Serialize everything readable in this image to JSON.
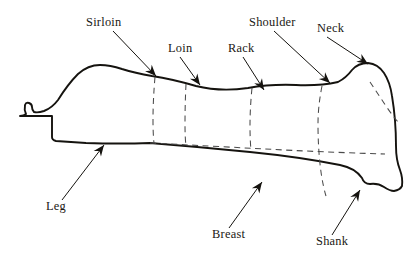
{
  "diagram": {
    "background_color": "#ffffff",
    "outline_color": "#15130f",
    "divider_color": "#4a4a4a",
    "label_color": "#1a1713",
    "labels": [
      {
        "id": "sirloin",
        "text": "Sirloin",
        "text_x": 86,
        "text_y": 26,
        "leader_from_x": 113,
        "leader_from_y": 31,
        "leader_to_x": 156,
        "leader_to_y": 76,
        "arrow_angle_deg": 46
      },
      {
        "id": "loin",
        "text": "Loin",
        "text_x": 168,
        "text_y": 52,
        "leader_from_x": 180,
        "leader_from_y": 57,
        "leader_to_x": 200,
        "leader_to_y": 85,
        "arrow_angle_deg": 55
      },
      {
        "id": "rack",
        "text": "Rack",
        "text_x": 228,
        "text_y": 52,
        "leader_from_x": 243,
        "leader_from_y": 57,
        "leader_to_x": 264,
        "leader_to_y": 90,
        "arrow_angle_deg": 58
      },
      {
        "id": "shoulder",
        "text": "Shoulder",
        "text_x": 249,
        "text_y": 26,
        "leader_from_x": 274,
        "leader_from_y": 31,
        "leader_to_x": 330,
        "leader_to_y": 83,
        "arrow_angle_deg": 43
      },
      {
        "id": "neck",
        "text": "Neck",
        "text_x": 317,
        "text_y": 32,
        "leader_from_x": 327,
        "leader_from_y": 37,
        "leader_to_x": 368,
        "leader_to_y": 64,
        "arrow_angle_deg": 33
      },
      {
        "id": "leg",
        "text": "Leg",
        "text_x": 46,
        "text_y": 210,
        "leader_from_x": 62,
        "leader_from_y": 200,
        "leader_to_x": 104,
        "leader_to_y": 145,
        "arrow_angle_deg": -52
      },
      {
        "id": "breast",
        "text": "Breast",
        "text_x": 212,
        "text_y": 238,
        "leader_from_x": 229,
        "leader_from_y": 228,
        "leader_to_x": 262,
        "leader_to_y": 182,
        "arrow_angle_deg": -54
      },
      {
        "id": "shank",
        "text": "Shank",
        "text_x": 316,
        "text_y": 245,
        "leader_from_x": 332,
        "leader_from_y": 235,
        "leader_to_x": 360,
        "leader_to_y": 190,
        "arrow_angle_deg": -58
      }
    ],
    "shapes": {
      "carcass_path": "M 52 116 L 52 137 Q 52 140 56 141 L 86 143 Q 120 144 150 143 Q 200 147 250 152 Q 300 157 340 165 Q 355 168 362 178 Q 364 184 370 184 Q 378 183 384 187 Q 390 191 394 191 Q 400 190 402 186 Q 403 178 400 170 Q 396 160 396 146 Q 396 120 392 96 Q 390 82 384 73 Q 378 64 368 63 Q 358 63 352 70 Q 346 78 338 82 Q 320 86 296 85 Q 270 84 248 88 Q 220 92 196 86 Q 172 79 152 76 Q 135 73 122 69 Q 110 65 100 65 Q 88 65 78 74 Q 68 84 58 100 Q 52 108 44 111 Q 38 113 34 112 Q 32 110 32 107 Q 32 104 29 103 Q 26 102 25 105 Q 24 110 26 114 Q 24 116 20 116 Z",
      "divider_sirloin": "M 155 77 Q 153 100 153 120 Q 153 134 154 143",
      "divider_loin": "M 186 84 Q 185 104 185 124 Q 185 138 186 146",
      "divider_rack": "M 252 88 Q 250 108 250 126 Q 250 140 251 150",
      "divider_shoulder": "M 322 86 Q 318 106 318 124 Q 318 150 321 172 Q 323 186 326 196",
      "divider_neck": "M 370 82 Q 378 94 386 106 Q 392 115 398 122",
      "divider_horizontal": "M 150 143 Q 210 146 265 149 Q 320 152 385 154"
    }
  }
}
